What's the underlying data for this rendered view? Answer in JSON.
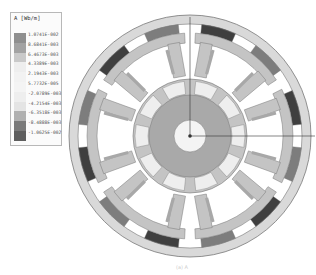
{
  "legend": {
    "title": "A [Wb/m]",
    "labels": [
      "1.0741E-002",
      "8.6841E-003",
      "6.4673E-003",
      "4.3389E-003",
      "2.1943E-003",
      "5.7732E-005",
      "-2.0789E-003",
      "-4.2154E-003",
      "-6.3518E-003",
      "-8.4888E-003",
      "-1.0625E-002"
    ],
    "colors": [
      "#8f8f8f",
      "#a3a3a3",
      "#c9c9c9",
      "#eeeeee",
      "#f2f2f2",
      "#f4f4f4",
      "#eeeeee",
      "#e4e4e4",
      "#b0b0b0",
      "#7a7a7a",
      "#5e5e5e"
    ]
  },
  "diagram": {
    "center": [
      190,
      136
    ],
    "outer_radius": 121,
    "magnet_count": 12,
    "magnet_colors": [
      "#3f3f3f",
      "#7d7d7d"
    ],
    "stator_modules": 6,
    "rotor_slots": 10,
    "colors": {
      "back_iron": "#d9d9d9",
      "stator": "#c4c4c4",
      "rotor_core": "#a9a9a9",
      "rotor_slot": "#eeeeee",
      "hub": "#f4f4f4",
      "outline": "#777777",
      "axis": "#333333"
    }
  },
  "caption": "(a) A"
}
